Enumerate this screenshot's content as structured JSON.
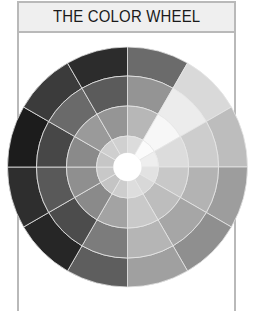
{
  "header": {
    "title": "THE COLOR WHEEL"
  },
  "wheel": {
    "center": [
      127.5,
      167
    ],
    "ring_radii": [
      120,
      91,
      61,
      31,
      14
    ],
    "sectors": 12,
    "start_angle_deg": 0,
    "divider_color": "#e6e6e6",
    "center_color": "#ffffff",
    "rings": [
      {
        "name": "outer",
        "colors": [
          "#6b6b6b",
          "#d9d9d9",
          "#bdbdbd",
          "#9d9d9d",
          "#8f8f8f",
          "#a0a0a0",
          "#5e5e5e",
          "#262626",
          "#2e2e2e",
          "#1c1c1c",
          "#3b3b3b",
          "#2c2c2c"
        ]
      },
      {
        "name": "second",
        "colors": [
          "#949494",
          "#ececec",
          "#cdcdcd",
          "#b3b3b3",
          "#a6a6a6",
          "#b5b5b5",
          "#7c7c7c",
          "#4c4c4c",
          "#595959",
          "#474747",
          "#6a6a6a",
          "#5b5b5b"
        ]
      },
      {
        "name": "third",
        "colors": [
          "#b7b7b7",
          "#f7f7f7",
          "#dcdcdc",
          "#c8c8c8",
          "#bdbdbd",
          "#c9c9c9",
          "#a3a3a3",
          "#8a8a8a",
          "#8f8f8f",
          "#8a8a8a",
          "#9a9a9a",
          "#959595"
        ]
      },
      {
        "name": "inner",
        "colors": [
          "#dcdcdc",
          "#fbfbfb",
          "#eeeeee",
          "#e2e2e2",
          "#d8d8d8",
          "#dddddd",
          "#cdcdcd",
          "#c4c4c4",
          "#c8c8c8",
          "#c6c6c6",
          "#cfcfcf",
          "#d0d0d0"
        ]
      }
    ]
  }
}
